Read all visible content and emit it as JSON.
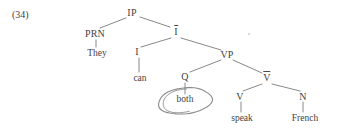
{
  "example": {
    "number_label": "(34)"
  },
  "diagram": {
    "type": "syntax-tree",
    "notation": "x-bar",
    "sentence": "They can both speak French",
    "stroke_color": "#6a6a6a",
    "text_color": "#3f3f3f",
    "background_color": "#ffffff",
    "nodes": [
      {
        "id": "IP",
        "label": "IP",
        "overbar": false,
        "x": 132,
        "y": 13,
        "kind": "phrase"
      },
      {
        "id": "PRN",
        "label": "PRN",
        "overbar": false,
        "x": 95,
        "y": 34,
        "kind": "phrase"
      },
      {
        "id": "They",
        "label": "They",
        "overbar": false,
        "x": 97,
        "y": 53,
        "kind": "terminal"
      },
      {
        "id": "Ibar",
        "label": "I",
        "overbar": true,
        "x": 176,
        "y": 32,
        "kind": "bar"
      },
      {
        "id": "I",
        "label": "I",
        "overbar": false,
        "x": 137,
        "y": 52,
        "kind": "head"
      },
      {
        "id": "can",
        "label": "can",
        "overbar": false,
        "x": 140,
        "y": 78,
        "kind": "terminal"
      },
      {
        "id": "VP",
        "label": "VP",
        "overbar": false,
        "x": 227,
        "y": 55,
        "kind": "phrase"
      },
      {
        "id": "Q",
        "label": "Q",
        "overbar": false,
        "x": 185,
        "y": 77,
        "kind": "head"
      },
      {
        "id": "both",
        "label": "both",
        "overbar": false,
        "x": 185,
        "y": 99,
        "kind": "terminal"
      },
      {
        "id": "Vbar",
        "label": "V",
        "overbar": true,
        "x": 267,
        "y": 78,
        "kind": "bar"
      },
      {
        "id": "V",
        "label": "V",
        "overbar": false,
        "x": 240,
        "y": 97,
        "kind": "head"
      },
      {
        "id": "speak",
        "label": "speak",
        "overbar": false,
        "x": 242,
        "y": 118,
        "kind": "terminal"
      },
      {
        "id": "N",
        "label": "N",
        "overbar": false,
        "x": 303,
        "y": 97,
        "kind": "head"
      },
      {
        "id": "French",
        "label": "French",
        "overbar": false,
        "x": 305,
        "y": 118,
        "kind": "terminal"
      }
    ],
    "edges": [
      {
        "from": "IP",
        "to": "PRN",
        "x1": 126,
        "y1": 18,
        "x2": 100,
        "y2": 28
      },
      {
        "from": "PRN",
        "to": "They",
        "x1": 96,
        "y1": 40,
        "x2": 96,
        "y2": 47
      },
      {
        "from": "IP",
        "to": "Ibar",
        "x1": 140,
        "y1": 17,
        "x2": 170,
        "y2": 27
      },
      {
        "from": "Ibar",
        "to": "I",
        "x1": 171,
        "y1": 38,
        "x2": 141,
        "y2": 47
      },
      {
        "from": "I",
        "to": "can",
        "x1": 139,
        "y1": 58,
        "x2": 139,
        "y2": 72
      },
      {
        "from": "Ibar",
        "to": "VP",
        "x1": 181,
        "y1": 38,
        "x2": 221,
        "y2": 50
      },
      {
        "from": "VP",
        "to": "Q",
        "x1": 221,
        "y1": 60,
        "x2": 190,
        "y2": 72
      },
      {
        "from": "Q",
        "to": "both",
        "x1": 185,
        "y1": 83,
        "x2": 185,
        "y2": 94
      },
      {
        "from": "VP",
        "to": "Vbar",
        "x1": 233,
        "y1": 60,
        "x2": 262,
        "y2": 73
      },
      {
        "from": "Vbar",
        "to": "V",
        "x1": 262,
        "y1": 84,
        "x2": 243,
        "y2": 91
      },
      {
        "from": "V",
        "to": "speak",
        "x1": 241,
        "y1": 102,
        "x2": 241,
        "y2": 112
      },
      {
        "from": "Vbar",
        "to": "N",
        "x1": 272,
        "y1": 84,
        "x2": 300,
        "y2": 91
      },
      {
        "from": "N",
        "to": "French",
        "x1": 303,
        "y1": 102,
        "x2": 303,
        "y2": 112
      }
    ],
    "annotation": {
      "type": "hand-drawn-ellipse",
      "target_node": "both",
      "label": "both",
      "stroke_color": "#8a8a8a",
      "cx": 185,
      "cy": 101,
      "rx": 27,
      "ry": 13,
      "rotation": -6,
      "double_stroke_side": "left"
    },
    "artifacts": [
      {
        "id": "speck-1",
        "x": 248,
        "y": 33
      }
    ]
  }
}
